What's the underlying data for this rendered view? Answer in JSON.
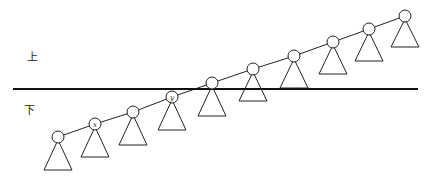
{
  "diagram": {
    "type": "spine-with-subtrees",
    "labels": {
      "upper": "上",
      "lower": "下"
    },
    "divider": {
      "x1": 13,
      "x2": 418,
      "y": 89,
      "color": "#111111",
      "width": 2
    },
    "spine_color": "#222222",
    "node_radius": 6,
    "triangle_half_width": 14,
    "nodes": [
      {
        "id": "n1",
        "cx": 58,
        "cy": 137,
        "base_y": 170,
        "label": ""
      },
      {
        "id": "n2",
        "cx": 95,
        "cy": 124,
        "base_y": 157,
        "label": "x"
      },
      {
        "id": "n3",
        "cx": 133,
        "cy": 112,
        "base_y": 145,
        "label": ""
      },
      {
        "id": "n4",
        "cx": 172,
        "cy": 97,
        "base_y": 130,
        "label": "y"
      },
      {
        "id": "n5",
        "cx": 212,
        "cy": 83,
        "base_y": 116,
        "label": ""
      },
      {
        "id": "n6",
        "cx": 253,
        "cy": 69,
        "base_y": 101,
        "label": ""
      },
      {
        "id": "n7",
        "cx": 294,
        "cy": 56,
        "base_y": 88,
        "label": ""
      },
      {
        "id": "n8",
        "cx": 333,
        "cy": 42,
        "base_y": 74,
        "label": ""
      },
      {
        "id": "n9",
        "cx": 369,
        "cy": 29,
        "base_y": 61,
        "label": ""
      },
      {
        "id": "n10",
        "cx": 405,
        "cy": 16,
        "base_y": 47,
        "label": ""
      }
    ]
  }
}
